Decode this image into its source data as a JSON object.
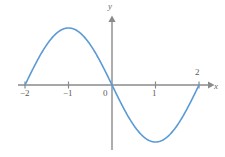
{
  "figure": {
    "name": "sine-curve-graph",
    "background_color": "#ffffff"
  },
  "axes": {
    "color": "#8a8a8a",
    "x_label": "x",
    "y_label": "y",
    "x_range": [
      -2.2,
      2.25
    ],
    "y_range": [
      -1.45,
      1.5
    ],
    "origin_label": "0",
    "ticks": {
      "x": [
        {
          "value": -2,
          "label": "−2",
          "position": "below"
        },
        {
          "value": -1,
          "label": "−1",
          "position": "below"
        },
        {
          "value": 0,
          "label": "0",
          "position": "below-left"
        },
        {
          "value": 1,
          "label": "1",
          "position": "below"
        },
        {
          "value": 2,
          "label": "2",
          "position": "above"
        }
      ],
      "y": []
    }
  },
  "chart_data": {
    "type": "line",
    "title": "",
    "subtitle": "",
    "xlabel": "x",
    "ylabel": "y",
    "xlim": [
      -2.2,
      2.25
    ],
    "ylim": [
      -1.45,
      1.5
    ],
    "grid": false,
    "legend": false,
    "series": [
      {
        "name": "y = sin(πx)",
        "color": "#5b9bd5",
        "line_width": 1.6,
        "x": [
          -2.0,
          -1.9,
          -1.8,
          -1.7,
          -1.6,
          -1.5,
          -1.4,
          -1.3,
          -1.2,
          -1.1,
          -1.0,
          -0.9,
          -0.8,
          -0.7,
          -0.6,
          -0.5,
          -0.4,
          -0.3,
          -0.2,
          -0.1,
          0.0,
          0.1,
          0.2,
          0.3,
          0.4,
          0.5,
          0.6,
          0.7,
          0.8,
          0.9,
          1.0,
          1.1,
          1.2,
          1.3,
          1.4,
          1.5,
          1.6,
          1.7,
          1.8,
          1.9,
          2.0
        ],
        "y": [
          0.0,
          0.309,
          0.588,
          0.809,
          0.951,
          1.0,
          0.951,
          0.809,
          0.588,
          0.309,
          0.0,
          -0.309,
          -0.588,
          -0.809,
          -0.951,
          -1.0,
          -0.951,
          -0.809,
          -0.588,
          -0.309,
          0.0,
          0.309,
          0.588,
          0.809,
          0.951,
          1.0,
          0.951,
          0.809,
          0.588,
          0.309,
          0.0,
          -0.309,
          -0.588,
          -0.809,
          -0.951,
          -1.0,
          -0.951,
          -0.809,
          -0.588,
          -0.309,
          0.0
        ],
        "note_peak": {
          "x": -1.5,
          "y": 1.0
        },
        "note_trough": {
          "x": 1.5,
          "y": -1.0
        },
        "zero_crossings": [
          -2,
          -1,
          0,
          1,
          2
        ]
      }
    ]
  }
}
